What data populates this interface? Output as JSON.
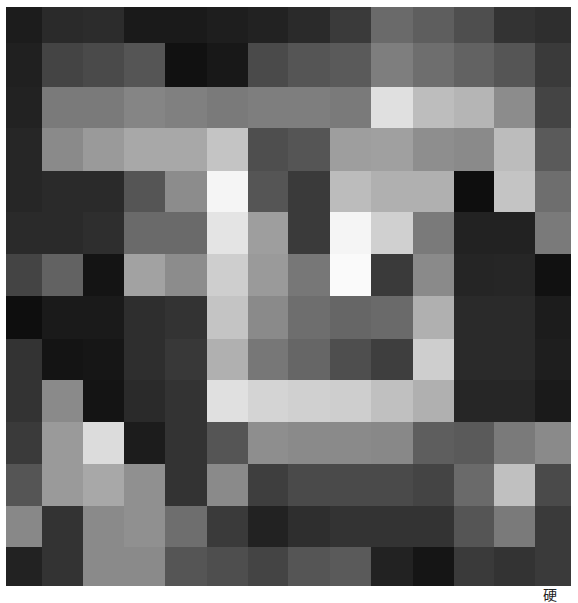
{
  "artwork": {
    "grid_size": {
      "rows": 14,
      "cols": 14
    },
    "cells": [
      [
        "#1c1c1c",
        "#2a2a2a",
        "#2c2c2c",
        "#1a1a1a",
        "#1a1a1a",
        "#1e1e1e",
        "#222222",
        "#2a2a2a",
        "#3a3a3a",
        "#6a6a6a",
        "#5e5e5e",
        "#4e4e4e",
        "#333333",
        "#2e2e2e"
      ],
      [
        "#202020",
        "#444444",
        "#4a4a4a",
        "#555555",
        "#111111",
        "#181818",
        "#4a4a4a",
        "#555555",
        "#5a5a5a",
        "#7e7e7e",
        "#6e6e6e",
        "#626262",
        "#555555",
        "#3a3a3a"
      ],
      [
        "#222222",
        "#7a7a7a",
        "#7a7a7a",
        "#858585",
        "#808080",
        "#7a7a7a",
        "#7e7e7e",
        "#7e7e7e",
        "#7a7a7a",
        "#e0e0e0",
        "#bdbdbd",
        "#b5b5b5",
        "#8c8c8c",
        "#444444"
      ],
      [
        "#262626",
        "#8a8a8a",
        "#9a9a9a",
        "#a8a8a8",
        "#a8a8a8",
        "#c4c4c4",
        "#4e4e4e",
        "#555555",
        "#9e9e9e",
        "#a0a0a0",
        "#8e8e8e",
        "#8a8a8a",
        "#bcbcbc",
        "#5a5a5a"
      ],
      [
        "#262626",
        "#2a2a2a",
        "#2a2a2a",
        "#555555",
        "#8c8c8c",
        "#f5f5f5",
        "#555555",
        "#3a3a3a",
        "#bcbcbc",
        "#b0b0b0",
        "#b0b0b0",
        "#0e0e0e",
        "#c4c4c4",
        "#6e6e6e"
      ],
      [
        "#2a2a2a",
        "#2a2a2a",
        "#2e2e2e",
        "#6a6a6a",
        "#6a6a6a",
        "#e4e4e4",
        "#9e9e9e",
        "#3a3a3a",
        "#f5f5f5",
        "#d0d0d0",
        "#7a7a7a",
        "#222222",
        "#222222",
        "#7a7a7a"
      ],
      [
        "#444444",
        "#626262",
        "#141414",
        "#a2a2a2",
        "#8c8c8c",
        "#cecece",
        "#9a9a9a",
        "#777777",
        "#fafafa",
        "#3a3a3a",
        "#8a8a8a",
        "#252525",
        "#262626",
        "#111111"
      ],
      [
        "#0e0e0e",
        "#1a1a1a",
        "#1a1a1a",
        "#2e2e2e",
        "#333333",
        "#c4c4c4",
        "#8a8a8a",
        "#6e6e6e",
        "#666666",
        "#6a6a6a",
        "#b0b0b0",
        "#2a2a2a",
        "#2a2a2a",
        "#1c1c1c"
      ],
      [
        "#333333",
        "#141414",
        "#161616",
        "#2e2e2e",
        "#383838",
        "#b0b0b0",
        "#777777",
        "#666666",
        "#4e4e4e",
        "#3e3e3e",
        "#cecece",
        "#2a2a2a",
        "#2a2a2a",
        "#1e1e1e"
      ],
      [
        "#333333",
        "#8a8a8a",
        "#141414",
        "#2a2a2a",
        "#333333",
        "#e0e0e0",
        "#d4d4d4",
        "#d0d0d0",
        "#cecece",
        "#c0c0c0",
        "#b0b0b0",
        "#262626",
        "#262626",
        "#1a1a1a"
      ],
      [
        "#3a3a3a",
        "#9a9a9a",
        "#dcdcdc",
        "#1c1c1c",
        "#333333",
        "#555555",
        "#8e8e8e",
        "#8a8a8a",
        "#8a8a8a",
        "#888888",
        "#5e5e5e",
        "#5a5a5a",
        "#7a7a7a",
        "#8a8a8a"
      ],
      [
        "#555555",
        "#9a9a9a",
        "#a8a8a8",
        "#909090",
        "#333333",
        "#8a8a8a",
        "#3e3e3e",
        "#4a4a4a",
        "#4a4a4a",
        "#4a4a4a",
        "#444444",
        "#6a6a6a",
        "#c0c0c0",
        "#4a4a4a"
      ],
      [
        "#888888",
        "#333333",
        "#8a8a8a",
        "#909090",
        "#6e6e6e",
        "#3a3a3a",
        "#222222",
        "#2e2e2e",
        "#333333",
        "#333333",
        "#333333",
        "#555555",
        "#7a7a7a",
        "#3a3a3a"
      ],
      [
        "#222222",
        "#333333",
        "#8a8a8a",
        "#8a8a8a",
        "#555555",
        "#4e4e4e",
        "#444444",
        "#555555",
        "#5a5a5a",
        "#222222",
        "#151515",
        "#3a3a3a",
        "#333333",
        "#3a3a3a"
      ]
    ]
  },
  "caption": {
    "text": "硬"
  }
}
